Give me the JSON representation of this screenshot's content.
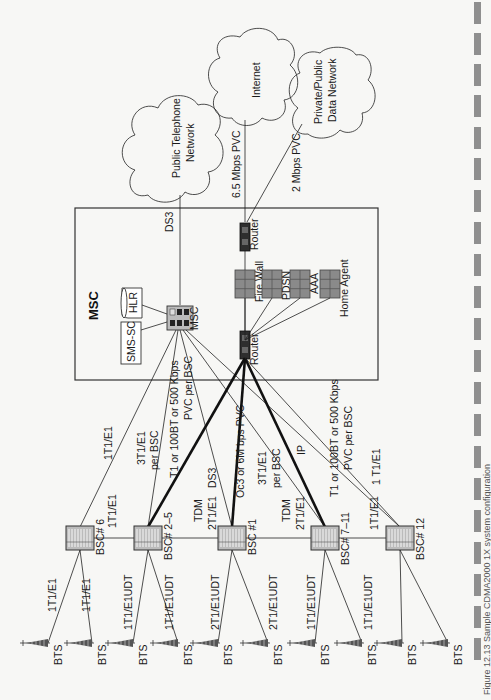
{
  "figure": {
    "orientation": "rotated-90-ccw",
    "caption": "Figure 12.13 Sample CDMA2000 1X system configuration"
  },
  "clouds": {
    "pstn": "Public Telephone Network",
    "pstn_l1": "Public Telephone",
    "pstn_l2": "Network",
    "internet": "Internet",
    "pdn_l1": "Private/Public",
    "pdn_l2": "Data Network"
  },
  "msc_box": {
    "title": "MSC",
    "switch_label": "MSC",
    "hlr": "HLR",
    "sms_sc": "SMS-SC",
    "router_top": "Router",
    "router_bottom": "Router",
    "servers": [
      "Fire Wall",
      "PDSN",
      "AAA",
      "Home Agent"
    ]
  },
  "links": {
    "pstn": "DS3",
    "internet": "6.5 Mbps PVC",
    "pdn": "2 Mbps PVC",
    "bsc6_msc": "1T1/E1",
    "bsc25_msc_l1": "3T1/E1",
    "bsc25_msc_l2": "per BSC",
    "bsc25_router_l1": "T1 or 100BT or 500 Kbps",
    "bsc25_router_l2": "PVC  per BSC",
    "bsc1_msc": "DS3",
    "bsc1_router": "Oc3 or 6M bps PVC",
    "bsc711_msc_l1": "3T1/E1",
    "bsc711_msc_l2": "per BSC",
    "bsc711_router": "IP",
    "bsc12_router_l1": "T1 or 100BT or 500 Kbps",
    "bsc12_router_l2": "PVC  per BSC",
    "bsc12_msc": "1 T1/E1",
    "bsc6_bsc25": "1T1/E1",
    "bsc25_bsc1_l1": "TDM",
    "bsc25_bsc1_l2": "2T1/E1",
    "bsc1_bsc711_l1": "TDM",
    "bsc1_bsc711_l2": "2T1/E1",
    "bsc711_bsc12": "1T1/E1"
  },
  "bscs": [
    "BSC# 6",
    "BSC# 2–5",
    "BSC #1",
    "BSC# 7–11",
    "BSC# 12"
  ],
  "bts_links": [
    "1T1/E1",
    "1T1/E1",
    "1T1/E1UDT",
    "1T1/E1UDT",
    "2T1/E1UDT",
    "2T1/E1UDT",
    "1T1/E1UDT",
    "1T1/E1UDT"
  ],
  "bts_label": "BTS",
  "colors": {
    "line": "#222222",
    "server_fill": "#8a8a8a",
    "router_fill": "#333333",
    "margin_bar": "#8f8f8f"
  }
}
